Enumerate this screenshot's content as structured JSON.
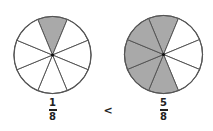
{
  "diagram": {
    "colors": {
      "shaded": "#a9a9a9",
      "unshaded": "#ffffff",
      "line": "#555555",
      "center": "#111111",
      "text": "#222222"
    },
    "sector_labels": [
      "top",
      "upper-right",
      "right",
      "lower-right",
      "bottom",
      "lower-left",
      "left",
      "upper-left"
    ],
    "circles": [
      {
        "name": "left",
        "cx": 52.5,
        "cy": 55,
        "r": 38.5,
        "divisions": 8,
        "shaded_sectors": [
          "top"
        ],
        "fraction": {
          "numerator": "1",
          "denominator": "8"
        }
      },
      {
        "name": "right",
        "cx": 163.5,
        "cy": 54.5,
        "r": 39,
        "divisions": 8,
        "shaded_sectors": [
          "top",
          "upper-left",
          "left",
          "lower-left",
          "bottom"
        ],
        "fraction": {
          "numerator": "5",
          "denominator": "8"
        }
      }
    ],
    "comparison_symbol": "<"
  }
}
